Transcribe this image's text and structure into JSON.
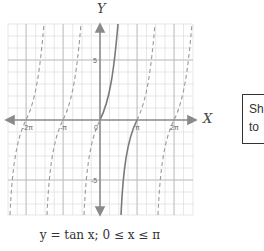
{
  "diagram": {
    "x_axis_label": "X",
    "y_axis_label": "Y",
    "x_tick_labels": [
      "-2π",
      "-π",
      "0",
      "π",
      "2π"
    ],
    "y_tick_labels": [
      "5",
      "-5"
    ],
    "caption": "y = tan x; 0 ≤ x ≤ π",
    "highlighted_curve": "tan x solid for 0 ≤ x ≤ π",
    "colors": {
      "grid": "#cfcfcf",
      "axis": "#8a8a8a",
      "curve": "#7a7a7a"
    }
  },
  "side_box": {
    "line1": "Sh",
    "line2": "to"
  }
}
